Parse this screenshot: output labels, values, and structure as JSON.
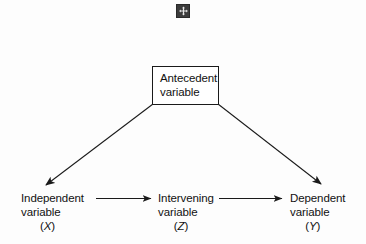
{
  "diagram": {
    "background_color": "#fdfdfd",
    "line_color": "#1a1a1a",
    "nodes": {
      "antecedent": {
        "line1": "Antecedent",
        "line2": "variable"
      },
      "independent": {
        "line1": "Independent",
        "line2": "variable",
        "code": "X",
        "paren_open": "(",
        "paren_close": ")"
      },
      "intervening": {
        "line1": "Intervening",
        "line2": "variable",
        "code": "Z",
        "paren_open": "(",
        "paren_close": ")"
      },
      "dependent": {
        "line1": "Dependent",
        "line2": "variable",
        "code": "Y",
        "paren_open": "(",
        "paren_close": ")"
      }
    },
    "connectors": [
      {
        "name": "antecedent-to-independent",
        "from": "antecedent",
        "to": "independent",
        "style": "diagonal-arrow"
      },
      {
        "name": "antecedent-to-dependent",
        "from": "antecedent",
        "to": "dependent",
        "style": "diagonal-arrow"
      },
      {
        "name": "independent-to-intervening",
        "from": "independent",
        "to": "intervening",
        "style": "horizontal-arrow"
      },
      {
        "name": "intervening-to-dependent",
        "from": "intervening",
        "to": "dependent",
        "style": "horizontal-arrow"
      }
    ],
    "top_icon": {
      "name": "move-handle-icon",
      "glyph": "four-way-arrow"
    }
  }
}
